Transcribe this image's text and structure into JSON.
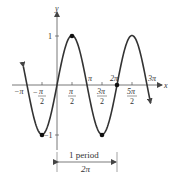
{
  "chart_data": {
    "type": "line",
    "title": "",
    "function": "y = sin x",
    "xlabel": "x",
    "ylabel": "y",
    "xlim": [
      -3.4,
      9.8
    ],
    "ylim": [
      -1,
      1
    ],
    "x_ticks": [
      "-π",
      "-π/2",
      "π/2",
      "π",
      "3π/2",
      "2π",
      "5π/2",
      "3π"
    ],
    "y_ticks": [
      "1",
      "-1"
    ],
    "marked_points": [
      {
        "x": "-π/2",
        "y": -1
      },
      {
        "x": "π/2",
        "y": 1
      },
      {
        "x": "3π/2",
        "y": -1
      },
      {
        "x": "2π",
        "y": 0
      }
    ],
    "annotation": {
      "label_top": "1 period",
      "label_bottom": "2π",
      "from": "0",
      "to": "2π"
    },
    "grid": false,
    "legend": null
  },
  "labels": {
    "x_axis": "x",
    "y_axis": "y",
    "y_one": "1",
    "y_neg_one": "−1",
    "neg_pi": "−π",
    "neg_pi_over_2_num": "π",
    "neg_pi_over_2_sign": "−",
    "pi_over_2_num": "π",
    "den_2": "2",
    "pi": "π",
    "three_pi_over_2_num": "3π",
    "two_pi": "2π",
    "five_pi_over_2_num": "5π",
    "three_pi": "3π",
    "period_top": "1 period",
    "period_bottom": "2π"
  },
  "colors": {
    "curve": "#333333",
    "axis": "#555555",
    "text": "#333333"
  }
}
